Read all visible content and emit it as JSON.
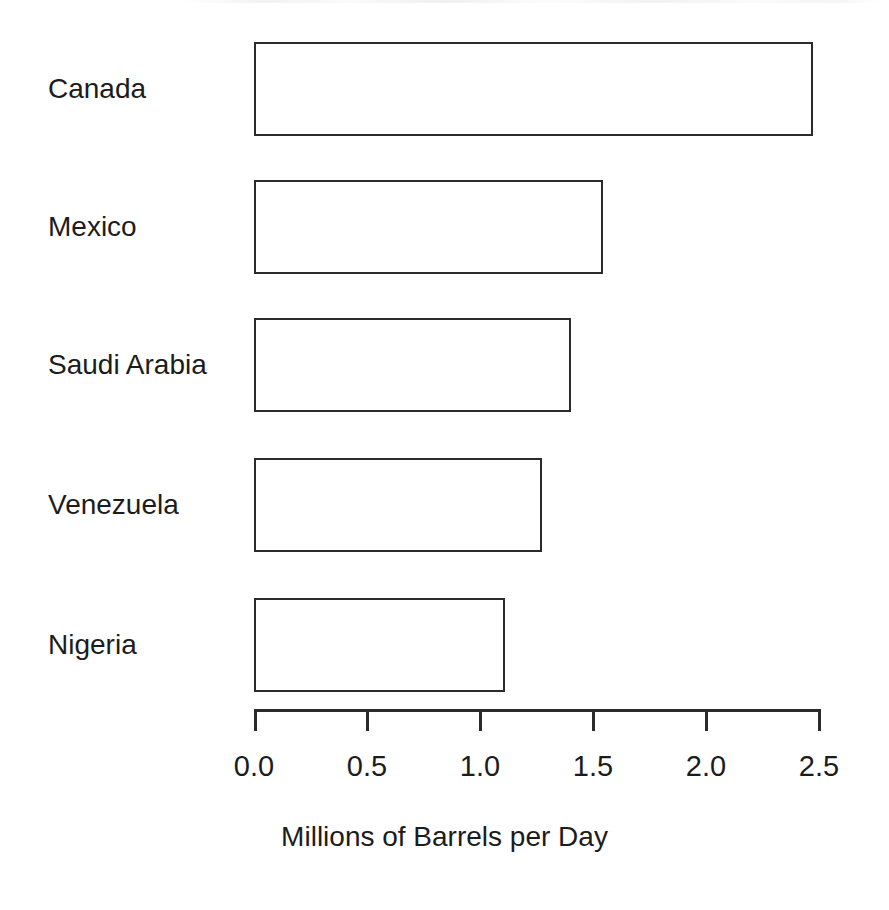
{
  "chart_data": {
    "type": "bar",
    "orientation": "horizontal",
    "title": "",
    "subtitle": "",
    "xlabel": "Millions of Barrels per Day",
    "ylabel": "",
    "categories": [
      "Canada",
      "Mexico",
      "Saudi Arabia",
      "Venezuela",
      "Nigeria"
    ],
    "values": [
      2.47,
      1.54,
      1.4,
      1.27,
      1.11
    ],
    "series": [
      {
        "name": "Crude Oil Imports",
        "values": [
          2.47,
          1.54,
          1.4,
          1.27,
          1.11
        ]
      }
    ],
    "xlim": [
      0.0,
      2.5
    ],
    "xticks": [
      0.0,
      0.5,
      1.0,
      1.5,
      2.0,
      2.5
    ],
    "xtick_labels": [
      "0.0",
      "0.5",
      "1.0",
      "1.5",
      "2.0",
      "2.5"
    ],
    "grid": false,
    "legend": false,
    "legend_position": "none",
    "bar_fill_color": "#ffffff",
    "bar_border_color": "#2b2b2b",
    "background_color": "#ffffff",
    "axis_color": "#2b2b2b",
    "text_color": "#1c1c1c",
    "annotations": []
  },
  "axis": {
    "title": "Millions of Barrels per Day",
    "ticks": [
      {
        "label": "0.0",
        "value": 0.0
      },
      {
        "label": "0.5",
        "value": 0.5
      },
      {
        "label": "1.0",
        "value": 1.0
      },
      {
        "label": "1.5",
        "value": 1.5
      },
      {
        "label": "2.0",
        "value": 2.0
      },
      {
        "label": "2.5",
        "value": 2.5
      }
    ]
  },
  "bars": [
    {
      "label": "Canada",
      "value": 2.47
    },
    {
      "label": "Mexico",
      "value": 1.54
    },
    {
      "label": "Saudi Arabia",
      "value": 1.4
    },
    {
      "label": "Venezuela",
      "value": 1.27
    },
    {
      "label": "Nigeria",
      "value": 1.11
    }
  ]
}
